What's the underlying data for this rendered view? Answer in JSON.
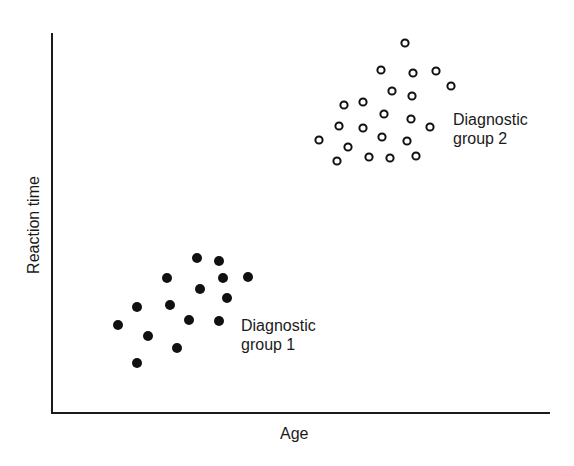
{
  "chart_data": {
    "type": "scatter",
    "title": "",
    "xlabel": "Age",
    "ylabel": "Reaction time",
    "grid": false,
    "ticks": "none",
    "legend": "none (inline annotations)",
    "series": [
      {
        "name": "Diagnostic group 1",
        "marker": "filled-circle",
        "annotation": [
          "Diagnostic",
          "group 1"
        ],
        "points_px": [
          [
            197,
            258
          ],
          [
            219,
            261
          ],
          [
            167,
            278
          ],
          [
            223,
            278
          ],
          [
            248,
            277
          ],
          [
            200,
            289
          ],
          [
            227,
            298
          ],
          [
            137,
            307
          ],
          [
            170,
            305
          ],
          [
            189,
            320
          ],
          [
            219,
            321
          ],
          [
            118,
            325
          ],
          [
            148,
            336
          ],
          [
            177,
            348
          ],
          [
            137,
            363
          ]
        ]
      },
      {
        "name": "Diagnostic group 2",
        "marker": "open-circle",
        "annotation": [
          "Diagnostic",
          "group 2"
        ],
        "points_px": [
          [
            405,
            43
          ],
          [
            381,
            70
          ],
          [
            413,
            73
          ],
          [
            436,
            71
          ],
          [
            451,
            86
          ],
          [
            392,
            91
          ],
          [
            412,
            96
          ],
          [
            344,
            105
          ],
          [
            363,
            102
          ],
          [
            384,
            114
          ],
          [
            411,
            119
          ],
          [
            339,
            126
          ],
          [
            363,
            128
          ],
          [
            430,
            127
          ],
          [
            319,
            140
          ],
          [
            348,
            147
          ],
          [
            382,
            137
          ],
          [
            407,
            141
          ],
          [
            337,
            161
          ],
          [
            369,
            157
          ],
          [
            390,
            158
          ],
          [
            416,
            156
          ]
        ]
      }
    ],
    "axes_px": {
      "origin": [
        52,
        413
      ],
      "y_top": 33,
      "x_right": 550
    }
  },
  "labels": {
    "ylabel": "Reaction time",
    "xlabel": "Age",
    "group1_line1": "Diagnostic",
    "group1_line2": "group 1",
    "group2_line1": "Diagnostic",
    "group2_line2": "group 2"
  }
}
